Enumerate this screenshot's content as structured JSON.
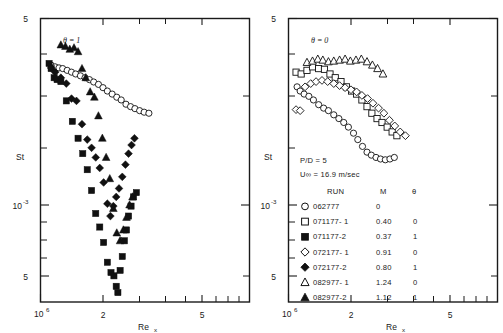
{
  "figure": {
    "background": "#ffffff",
    "ink_color": "#111111"
  },
  "panels": [
    {
      "id": "left",
      "annotation": "θ = 1",
      "x_axis": {
        "label": "Re",
        "label_sub": "x",
        "min_label": "10",
        "min_label_exp": "6",
        "ticks": [
          "2",
          "3",
          "4",
          "5"
        ],
        "tick_labels_shown": [
          "2",
          "5"
        ]
      },
      "y_axis": {
        "label": "St",
        "top_label": "5",
        "mid_label": "10",
        "mid_label_exp": "-3",
        "low_label": "5"
      }
    },
    {
      "id": "right",
      "annotation": "θ = 0",
      "x_axis": {
        "label": "Re",
        "label_sub": "x",
        "min_label": "10",
        "min_label_exp": "6",
        "ticks": [
          "2",
          "3",
          "4",
          "5"
        ],
        "tick_labels_shown": [
          "2",
          "5"
        ]
      },
      "y_axis": {
        "label": "St",
        "top_label": "5",
        "mid_label": "10",
        "mid_label_exp": "-3",
        "low_label": "5"
      }
    }
  ],
  "legend": {
    "conditions": [
      "P/D = 5",
      "U∞  = 16.9 m/sec"
    ],
    "pd_ratio": "P/D = 5",
    "velocity": "U∞  = 16.9 m/sec",
    "headers": {
      "run": "RUN",
      "m": "M",
      "theta": "θ"
    },
    "rows": [
      {
        "symbol": "circle-open",
        "run": "062777",
        "m": "0",
        "theta": ""
      },
      {
        "symbol": "square-open",
        "run": "071177- 1",
        "m": "0.40",
        "theta": "0"
      },
      {
        "symbol": "square-filled",
        "run": "071177-2",
        "m": "0.37",
        "theta": "1"
      },
      {
        "symbol": "diamond-open",
        "run": "072177- 1",
        "m": "0.91",
        "theta": "0"
      },
      {
        "symbol": "diamond-filled",
        "run": "072177-2",
        "m": "0.80",
        "theta": "1"
      },
      {
        "symbol": "triangle-open",
        "run": "082977- 1",
        "m": "1.24",
        "theta": "0"
      },
      {
        "symbol": "triangle-filled",
        "run": "082977-2",
        "m": "1.12",
        "theta": "1"
      }
    ]
  },
  "chart_data": {
    "type": "scatter",
    "title": "",
    "xlabel": "Re_x",
    "ylabel": "St",
    "xscale": "log",
    "yscale": "log",
    "xlim": [
      1000000,
      6500000
    ],
    "ylim": [
      0.0004,
      0.005
    ],
    "grid": false,
    "legend_position": "right-panel-lower-left",
    "panels": [
      {
        "name": "left",
        "annotation": "theta = 1",
        "series": [
          {
            "name": "062777",
            "symbol": "circle-open",
            "m": 0,
            "theta": null,
            "points": [
              [
                1100000.0,
                0.0033
              ],
              [
                1140000.0,
                0.00325
              ],
              [
                1180000.0,
                0.00322
              ],
              [
                1220000.0,
                0.0032
              ],
              [
                1270000.0,
                0.00315
              ],
              [
                1320000.0,
                0.0031
              ],
              [
                1370000.0,
                0.00305
              ],
              [
                1430000.0,
                0.003
              ],
              [
                1490000.0,
                0.00295
              ],
              [
                1550000.0,
                0.0029
              ],
              [
                1610000.0,
                0.00284
              ],
              [
                1680000.0,
                0.00278
              ],
              [
                1750000.0,
                0.0027
              ],
              [
                1820000.0,
                0.00262
              ],
              [
                1900000.0,
                0.00255
              ],
              [
                1980000.0,
                0.00248
              ],
              [
                2060000.0,
                0.00242
              ],
              [
                2150000.0,
                0.00233
              ],
              [
                2240000.0,
                0.00228
              ],
              [
                2330000.0,
                0.00224
              ],
              [
                2430000.0,
                0.0022
              ],
              [
                2530000.0,
                0.00217
              ],
              [
                2640000.0,
                0.00215
              ]
            ]
          },
          {
            "name": "071177-2",
            "symbol": "square-filled",
            "m": 0.37,
            "theta": 1,
            "points": [
              [
                1080000.0,
                0.00335
              ],
              [
                1100000.0,
                0.0032
              ],
              [
                1130000.0,
                0.00295
              ],
              [
                1160000.0,
                0.0029
              ],
              [
                1200000.0,
                0.00285
              ],
              [
                1260000.0,
                0.0024
              ],
              [
                1330000.0,
                0.002
              ],
              [
                1400000.0,
                0.00172
              ],
              [
                1460000.0,
                0.0015
              ],
              [
                1520000.0,
                0.0013
              ],
              [
                1580000.0,
                0.00108
              ],
              [
                1640000.0,
                0.00088
              ],
              [
                1700000.0,
                0.00078
              ],
              [
                1760000.0,
                0.00068
              ],
              [
                1820000.0,
                0.00057
              ],
              [
                1880000.0,
                0.00052
              ],
              [
                1930000.0,
                0.000505
              ],
              [
                1970000.0,
                0.00046
              ],
              [
                2000000.0,
                0.000435
              ],
              [
                2040000.0,
                0.00053
              ],
              [
                2080000.0,
                0.0006
              ],
              [
                2120000.0,
                0.00069
              ],
              [
                2160000.0,
                0.00076
              ],
              [
                2200000.0,
                0.00086
              ],
              [
                2250000.0,
                0.00094
              ],
              [
                2300000.0,
                0.00102
              ],
              [
                2360000.0,
                0.00106
              ]
            ]
          },
          {
            "name": "072177-2",
            "symbol": "diamond-filled",
            "m": 0.8,
            "theta": 1,
            "points": [
              [
                1100000.0,
                0.00322
              ],
              [
                1140000.0,
                0.0031
              ],
              [
                1200000.0,
                0.00295
              ],
              [
                1260000.0,
                0.0028
              ],
              [
                1320000.0,
                0.00245
              ],
              [
                1380000.0,
                0.0024
              ],
              [
                1450000.0,
                0.00195
              ],
              [
                1520000.0,
                0.0017
              ],
              [
                1580000.0,
                0.00158
              ],
              [
                1640000.0,
                0.00145
              ],
              [
                1700000.0,
                0.00132
              ],
              [
                1760000.0,
                0.00116
              ],
              [
                1820000.0,
                0.00096
              ],
              [
                1870000.0,
                0.00086
              ],
              [
                1920000.0,
                0.00094
              ],
              [
                1970000.0,
                0.00102
              ],
              [
                2020000.0,
                0.0011
              ],
              [
                2080000.0,
                0.00122
              ],
              [
                2140000.0,
                0.00136
              ],
              [
                2200000.0,
                0.0015
              ],
              [
                2260000.0,
                0.00162
              ],
              [
                2320000.0,
                0.00172
              ]
            ]
          },
          {
            "name": "082977-2",
            "symbol": "triangle-filled",
            "m": 1.12,
            "theta": 1,
            "points": [
              [
                1200000.0,
                0.00395
              ],
              [
                1250000.0,
                0.0039
              ],
              [
                1300000.0,
                0.0038
              ],
              [
                1350000.0,
                0.00385
              ],
              [
                1400000.0,
                0.00372
              ],
              [
                1450000.0,
                0.0032
              ],
              [
                1500000.0,
                0.00295
              ],
              [
                1560000.0,
                0.0026
              ],
              [
                1620000.0,
                0.00248
              ],
              [
                1680000.0,
                0.0021
              ],
              [
                1740000.0,
                0.00172
              ],
              [
                1800000.0,
                0.00145
              ],
              [
                1860000.0,
                0.0012
              ],
              [
                1920000.0,
                0.00092
              ],
              [
                1980000.0,
                0.00074
              ],
              [
                2040000.0,
                0.00069
              ],
              [
                2100000.0,
                0.00076
              ],
              [
                2160000.0,
                0.00085
              ],
              [
                2220000.0,
                0.00095
              ],
              [
                2280000.0,
                0.00102
              ]
            ]
          }
        ]
      },
      {
        "name": "right",
        "annotation": "theta = 0",
        "series": [
          {
            "name": "062777",
            "symbol": "circle-open",
            "m": 0,
            "theta": null,
            "points": [
              [
                1080000.0,
                0.00272
              ],
              [
                1110000.0,
                0.00262
              ],
              [
                1150000.0,
                0.00255
              ],
              [
                1200000.0,
                0.0025
              ],
              [
                1250000.0,
                0.00242
              ],
              [
                1310000.0,
                0.00232
              ],
              [
                1370000.0,
                0.00225
              ],
              [
                1430000.0,
                0.0022
              ],
              [
                1500000.0,
                0.00212
              ],
              [
                1570000.0,
                0.00205
              ],
              [
                1640000.0,
                0.00198
              ],
              [
                1710000.0,
                0.0019
              ],
              [
                1790000.0,
                0.0018
              ],
              [
                1860000.0,
                0.0017
              ],
              [
                1940000.0,
                0.0016
              ],
              [
                2020000.0,
                0.00152
              ],
              [
                2100000.0,
                0.00148
              ],
              [
                2190000.0,
                0.00145
              ],
              [
                2280000.0,
                0.00143
              ],
              [
                2380000.0,
                0.00142
              ],
              [
                2480000.0,
                0.00143
              ],
              [
                2580000.0,
                0.00145
              ]
            ]
          },
          {
            "name": "071177-1",
            "symbol": "square-open",
            "m": 0.4,
            "theta": 0,
            "points": [
              [
                1070000.0,
                0.0031
              ],
              [
                1120000.0,
                0.00305
              ],
              [
                1180000.0,
                0.00315
              ],
              [
                1240000.0,
                0.00325
              ],
              [
                1310000.0,
                0.0032
              ],
              [
                1380000.0,
                0.00318
              ],
              [
                1450000.0,
                0.00305
              ],
              [
                1520000.0,
                0.00295
              ],
              [
                1600000.0,
                0.00285
              ],
              [
                1680000.0,
                0.00272
              ],
              [
                1760000.0,
                0.00262
              ],
              [
                1840000.0,
                0.00255
              ],
              [
                1930000.0,
                0.00242
              ],
              [
                2020000.0,
                0.00228
              ],
              [
                2110000.0,
                0.00215
              ],
              [
                2210000.0,
                0.00205
              ],
              [
                2310000.0,
                0.00198
              ],
              [
                2420000.0,
                0.0019
              ],
              [
                2530000.0,
                0.00182
              ],
              [
                2640000.0,
                0.00176
              ]
            ]
          },
          {
            "name": "072177-1",
            "symbol": "diamond-open",
            "m": 0.91,
            "theta": 0,
            "points": [
              [
                1070000.0,
                0.00222
              ],
              [
                1110000.0,
                0.0022
              ],
              [
                1160000.0,
                0.00272
              ],
              [
                1220000.0,
                0.0028
              ],
              [
                1280000.0,
                0.00285
              ],
              [
                1350000.0,
                0.00288
              ],
              [
                1420000.0,
                0.00285
              ],
              [
                1500000.0,
                0.0028
              ],
              [
                1580000.0,
                0.00275
              ],
              [
                1660000.0,
                0.0027
              ],
              [
                1750000.0,
                0.00265
              ],
              [
                1840000.0,
                0.0026
              ],
              [
                1930000.0,
                0.00252
              ],
              [
                2030000.0,
                0.00245
              ],
              [
                2130000.0,
                0.00235
              ],
              [
                2240000.0,
                0.00225
              ],
              [
                2350000.0,
                0.00215
              ],
              [
                2470000.0,
                0.00202
              ],
              [
                2590000.0,
                0.00192
              ],
              [
                2720000.0,
                0.00182
              ],
              [
                2850000.0,
                0.00176
              ]
            ]
          },
          {
            "name": "082977-1",
            "symbol": "triangle-open",
            "m": 1.24,
            "theta": 0,
            "points": [
              [
                1180000.0,
                0.00338
              ],
              [
                1240000.0,
                0.00342
              ],
              [
                1300000.0,
                0.00348
              ],
              [
                1360000.0,
                0.00345
              ],
              [
                1430000.0,
                0.0034
              ],
              [
                1500000.0,
                0.00342
              ],
              [
                1580000.0,
                0.00345
              ],
              [
                1660000.0,
                0.00348
              ],
              [
                1740000.0,
                0.00342
              ],
              [
                1830000.0,
                0.00345
              ],
              [
                1920000.0,
                0.00348
              ],
              [
                2020000.0,
                0.0034
              ],
              [
                2120000.0,
                0.0033
              ],
              [
                2220000.0,
                0.0032
              ],
              [
                2330000.0,
                0.00305
              ]
            ]
          }
        ]
      }
    ]
  }
}
